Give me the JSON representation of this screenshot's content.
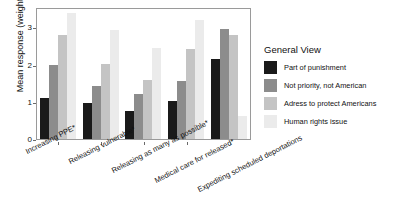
{
  "chart_data": {
    "type": "bar",
    "title": "",
    "xlabel": "",
    "ylabel": "Mean response (weighted)",
    "ylim": [
      0,
      3.55
    ],
    "yticks": [
      "0",
      "1",
      "2",
      "3"
    ],
    "grid": false,
    "legend_position": "right",
    "legend_title": "General View",
    "categories": [
      "Increasing PPE*",
      "Releasing vulnerable*",
      "Releasing as many as possible*",
      "Medical care for released*",
      "Expediting scheduled deportations"
    ],
    "series": [
      {
        "name": "Part of punishment",
        "color": "#1a1a1a",
        "values": [
          1.1,
          0.96,
          0.76,
          1.03,
          2.15
        ]
      },
      {
        "name": "Not priority, not American",
        "color": "#8c8c8c",
        "values": [
          1.98,
          1.42,
          1.22,
          1.55,
          2.95
        ]
      },
      {
        "name": "Adress to protect Americans",
        "color": "#c4c4c4",
        "values": [
          2.81,
          2.02,
          1.6,
          2.41,
          2.8
        ]
      },
      {
        "name": "Human rights issue",
        "color": "#ebebeb",
        "values": [
          3.38,
          2.94,
          2.46,
          3.19,
          0.62
        ]
      }
    ]
  },
  "axis": {
    "y_title": "Mean response (weighted)"
  }
}
